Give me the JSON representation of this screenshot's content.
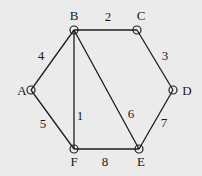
{
  "diagram": {
    "type": "weighted-graph",
    "background": "#ebebeb",
    "line_color": "#1e1e1e",
    "nodes": [
      {
        "id": "A",
        "label": "A",
        "x": 31,
        "y": 90,
        "lx": 22,
        "ly": 95
      },
      {
        "id": "B",
        "label": "B",
        "x": 74,
        "y": 30,
        "lx": 74,
        "ly": 20
      },
      {
        "id": "C",
        "label": "C",
        "x": 137,
        "y": 30,
        "lx": 141,
        "ly": 20
      },
      {
        "id": "D",
        "label": "D",
        "x": 173,
        "y": 90,
        "lx": 187,
        "ly": 95
      },
      {
        "id": "E",
        "label": "E",
        "x": 139,
        "y": 149,
        "lx": 141,
        "ly": 166
      },
      {
        "id": "F",
        "label": "F",
        "x": 74,
        "y": 149,
        "lx": 74,
        "ly": 166
      }
    ],
    "edges": [
      {
        "from": "B",
        "to": "F",
        "label": "1",
        "lx": 80,
        "ly": 120
      },
      {
        "from": "B",
        "to": "C",
        "label": "2",
        "lx": 108,
        "ly": 21
      },
      {
        "from": "C",
        "to": "D",
        "label": "3",
        "lx": 165,
        "ly": 60
      },
      {
        "from": "A",
        "to": "B",
        "label": "4",
        "lx": 41,
        "ly": 60
      },
      {
        "from": "A",
        "to": "F",
        "label": "5",
        "lx": 43,
        "ly": 128
      },
      {
        "from": "B",
        "to": "E",
        "label": "6",
        "lx": 131,
        "ly": 118
      },
      {
        "from": "D",
        "to": "E",
        "label": "7",
        "lx": 164,
        "ly": 127
      },
      {
        "from": "F",
        "to": "E",
        "label": "8",
        "lx": 105,
        "ly": 166
      }
    ]
  }
}
